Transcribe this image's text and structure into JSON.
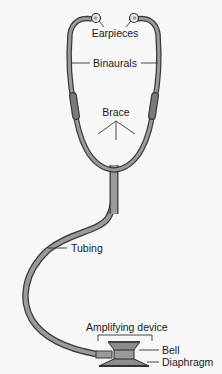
{
  "diagram": {
    "labels": {
      "earpieces": "Earpieces",
      "binaurals": "Binaurals",
      "brace": "Brace",
      "tubing": "Tubing",
      "amplifying_device": "Amplifying device",
      "bell": "Bell",
      "diaphragm": "Diaphragm"
    },
    "colors": {
      "background": "#f7f7f7",
      "tube_fill": "#9a9a9a",
      "tube_outline": "#3a3a3a",
      "sleeve_fill": "#7a7a7a",
      "chestpiece_fill": "#8c8c8c",
      "leader_line": "#333333"
    }
  }
}
